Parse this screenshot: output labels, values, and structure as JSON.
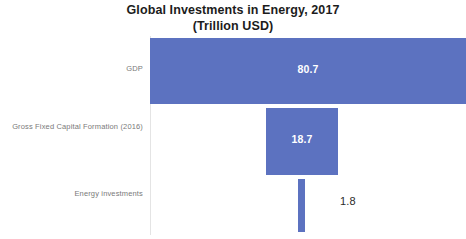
{
  "chart_data": {
    "type": "bar",
    "orientation": "horizontal",
    "title": "Global Investments in Energy, 2017 (Trillion USD)",
    "title_line_1": "Global Investments in Energy, 2017",
    "title_line_2": "(Trillion USD)",
    "xlabel": "",
    "ylabel": "",
    "categories": [
      "GDP",
      "Gross Fixed Capital Formation (2016)",
      "Energy investments"
    ],
    "values": [
      80.7,
      18.7,
      1.8
    ],
    "value_labels": [
      "80.7",
      "18.7",
      "1.8"
    ],
    "xlim": [
      0,
      80.7
    ],
    "grid": false,
    "legend": false,
    "units": "Trillion USD",
    "bar_color": "#5c72c0",
    "value_label_color_inside": "#ffffff",
    "value_label_color_outside": "#2b2b2b",
    "category_label_color": "#7a7a7a",
    "title_color": "#1c1c1c",
    "background_color": "#ffffff"
  },
  "chart": {
    "title_line_1": "Global Investments in Energy, 2017",
    "title_line_2": "(Trillion USD)",
    "bars": [
      {
        "category": "GDP",
        "value_label": "80.7"
      },
      {
        "category": "Gross Fixed Capital Formation (2016)",
        "value_label": "18.7"
      },
      {
        "category": "Energy investments",
        "value_label": "1.8"
      }
    ]
  }
}
